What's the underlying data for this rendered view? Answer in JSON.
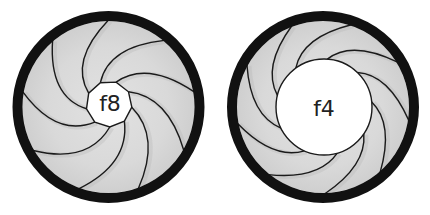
{
  "diagram": {
    "type": "aperture-comparison",
    "colors": {
      "background": "#ffffff",
      "ring": "#111111",
      "blade_fill": "#d9d9d9",
      "blade_shadow": "#b8b8b8",
      "blade_edge": "#1a1a1a",
      "opening": "#ffffff",
      "label": "#222222"
    },
    "irises": [
      {
        "id": "f8",
        "label": "f8",
        "cx": 108.5,
        "cy": 107,
        "outer_r": 96,
        "ring_width": 10,
        "opening_r": 23,
        "opening_cx": 109,
        "opening_cy": 104,
        "blades": 9,
        "rotation": 8,
        "sweep": 62,
        "label_x": 110,
        "label_y": 104
      },
      {
        "id": "f4",
        "label": "f4",
        "cx": 323,
        "cy": 107,
        "outer_r": 96,
        "ring_width": 10,
        "opening_r": 48,
        "opening_cx": 324,
        "opening_cy": 107,
        "blades": 9,
        "rotation": -6,
        "sweep": 55,
        "label_x": 324,
        "label_y": 109
      }
    ]
  }
}
